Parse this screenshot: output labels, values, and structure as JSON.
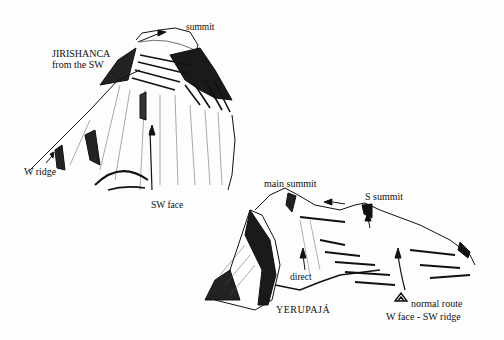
{
  "diagram": {
    "type": "hand-drawn mountain route sketch",
    "panels": [
      {
        "name": "jirishanca",
        "title": "JIRISHANCA",
        "subtitle": "from the SW",
        "labels": {
          "summit": "summit",
          "w_ridge": "W ridge",
          "sw_face": "SW face"
        }
      },
      {
        "name": "yerupaja",
        "title": "YERUPAJÁ",
        "labels": {
          "main_summit": "main summit",
          "s_summit": "S summit",
          "direct": "direct",
          "normal_route": "normal route",
          "normal_route_detail": "W face - SW ridge"
        },
        "camp_symbol": "tent-icon"
      }
    ],
    "colors": {
      "ink": "#111111",
      "paper": "#fdfdfd"
    }
  }
}
